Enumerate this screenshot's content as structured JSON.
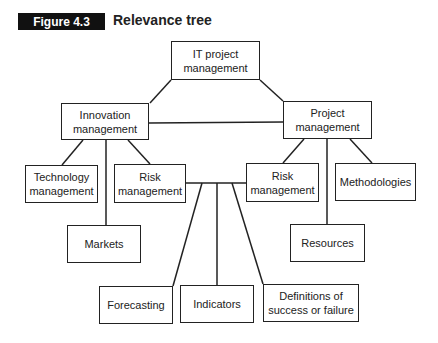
{
  "figure": {
    "label": "Figure 4.3",
    "title": "Relevance tree"
  },
  "nodes": {
    "root": "IT project\nmanagement",
    "innovation": "Innovation\nmanagement",
    "project": "Project\nmanagement",
    "technology": "Technology\nmanagement",
    "risk_left": "Risk\nmanagement",
    "risk_right": "Risk\nmanagement",
    "methodologies": "Methodologies",
    "markets": "Markets",
    "resources": "Resources",
    "forecasting": "Forecasting",
    "indicators": "Indicators",
    "definitions": "Definitions of\nsuccess or failure"
  },
  "colors": {
    "line": "#222222",
    "label_bg": "#111111"
  }
}
